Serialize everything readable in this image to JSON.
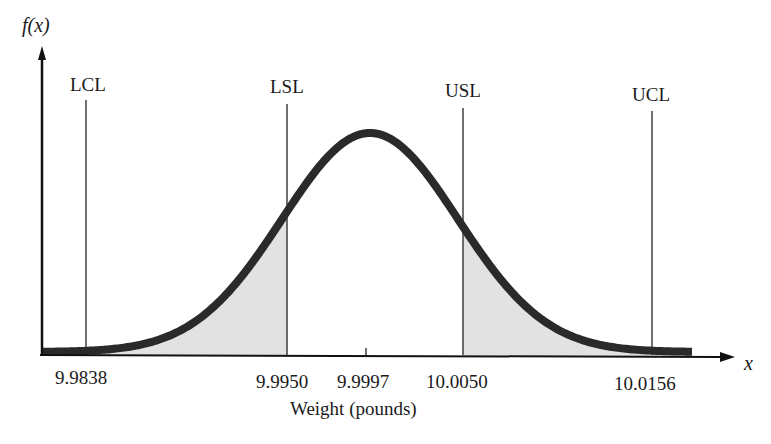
{
  "chart_data": {
    "type": "area",
    "title": "",
    "xlabel": "Weight (pounds)",
    "ylabel": "f(x)",
    "x_axis_symbol": "x",
    "distribution": "normal",
    "mean": 9.9997,
    "tick_labels": [
      "9.9838",
      "9.9950",
      "9.9997",
      "10.0050",
      "10.0156"
    ],
    "ticks": [
      9.9838,
      9.995,
      9.9997,
      10.005,
      10.0156
    ],
    "reference_lines": [
      {
        "name": "LCL",
        "x": 9.9838
      },
      {
        "name": "LSL",
        "x": 9.995
      },
      {
        "name": "USL",
        "x": 10.005
      },
      {
        "name": "UCL",
        "x": 10.0156
      }
    ],
    "shaded_regions": [
      {
        "description": "area below LSL",
        "from": "left tail",
        "to": 9.995
      },
      {
        "description": "area above USL",
        "from": 10.005,
        "to": "right tail"
      }
    ],
    "grid": false,
    "legend": null
  },
  "labels": {
    "ylabel": "f(x)",
    "xsymbol": "x",
    "xlabel": "Weight (pounds)",
    "lcl": "LCL",
    "lsl": "LSL",
    "usl": "USL",
    "ucl": "UCL",
    "t1": "9.9838",
    "t2": "9.9950",
    "t3": "9.9997",
    "t4": "10.0050",
    "t5": "10.0156"
  },
  "colors": {
    "curve": "#2a2a2a",
    "shade": "#e0e0e0",
    "axis": "#111111"
  }
}
